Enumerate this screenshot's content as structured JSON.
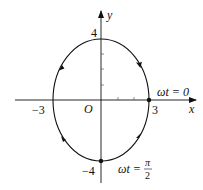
{
  "diagram": {
    "type": "ellipse-trajectory",
    "axes": {
      "x_label": "x",
      "y_label": "y",
      "origin_label": "O"
    },
    "tick_labels": {
      "x_pos": "3",
      "x_neg": "−3",
      "y_pos": "4",
      "y_neg": "−4"
    },
    "ellipse": {
      "semi_axis_x": 3,
      "semi_axis_y": 4,
      "direction": "clockwise"
    },
    "points": [
      {
        "name": "start",
        "x": 3,
        "y": 0,
        "label": "ωt = 0"
      },
      {
        "name": "quarter",
        "x": 0,
        "y": -4,
        "label_prefix": "ωt =",
        "label_num": "π",
        "label_den": "2"
      }
    ],
    "colors": {
      "stroke": "#111111",
      "background": "#ffffff"
    }
  }
}
